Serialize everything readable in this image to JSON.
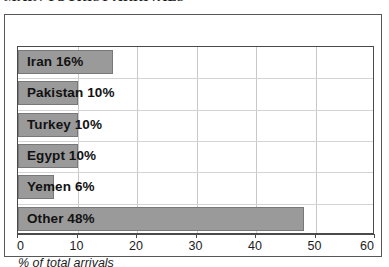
{
  "chart_data": {
    "type": "bar",
    "orientation": "horizontal",
    "title": "MAIN TOURIST ARRIVALS",
    "xlabel": "% of total arrivals",
    "ylabel": "",
    "xlim": [
      0,
      60
    ],
    "xticks": [
      0,
      10,
      20,
      30,
      40,
      50,
      60
    ],
    "xtick_labels": [
      "0",
      "10",
      "20",
      "30",
      "40",
      "50",
      "60"
    ],
    "grid": "vertical",
    "legend": "none",
    "bar_color": "#9a9a9a",
    "bar_edge_color": "#787878",
    "categories": [
      "Iran",
      "Pakistan",
      "Turkey",
      "Egypt",
      "Yemen",
      "Other"
    ],
    "values": [
      16,
      10,
      10,
      10,
      6,
      48
    ],
    "data_labels": [
      "Iran 16%",
      "Pakistan 10%",
      "Turkey 10%",
      "Egypt 10%",
      "Yemen 6%",
      "Other 48%"
    ],
    "bars": [
      {
        "category": "Iran",
        "value": 16,
        "label": "Iran 16%"
      },
      {
        "category": "Pakistan",
        "value": 10,
        "label": "Pakistan 10%"
      },
      {
        "category": "Turkey",
        "value": 10,
        "label": "Turkey 10%"
      },
      {
        "category": "Egypt",
        "value": 10,
        "label": "Egypt 10%"
      },
      {
        "category": "Yemen",
        "value": 6,
        "label": "Yemen 6%"
      },
      {
        "category": "Other",
        "value": 48,
        "label": "Other 48%"
      }
    ]
  }
}
